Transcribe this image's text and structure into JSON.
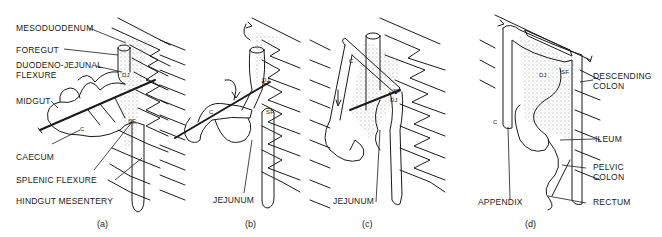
{
  "figure": {
    "type": "anatomical-diagram",
    "panels": [
      {
        "id": "a",
        "caption": "(a)",
        "labels": [
          "MESODUODENUM",
          "FOREGUT",
          "DUODENO-JEJUNAL",
          "FLEXURE",
          "MIDGUT",
          "CAECUM",
          "SPLENIC FLEXURE",
          "HINDGUT MESENTERY"
        ],
        "markers": [
          "DJ",
          "SF",
          "C"
        ]
      },
      {
        "id": "b",
        "caption": "(b)",
        "labels": [
          "JEJUNUM"
        ],
        "markers": [
          "DJ",
          "SF",
          "C"
        ]
      },
      {
        "id": "c",
        "caption": "(c)",
        "labels": [
          "JEJUNUM"
        ],
        "markers": [
          "C",
          "SF",
          "DJ"
        ]
      },
      {
        "id": "d",
        "caption": "(d)",
        "labels": [
          "DESCENDING",
          "COLON",
          "ILEUM",
          "PELVIC",
          "COLON",
          "APPENDIX",
          "RECTUM"
        ],
        "markers": [
          "DJ",
          "SF",
          "C"
        ]
      }
    ]
  },
  "text": {
    "a": {
      "mesoduodenum": "MESODUODENUM",
      "foregut": "FOREGUT",
      "dj_flexure_1": "DUODENO-JEJUNAL",
      "dj_flexure_2": "FLEXURE",
      "midgut": "MIDGUT",
      "caecum": "CAECUM",
      "splenic": "SPLENIC FLEXURE",
      "hindgut": "HINDGUT MESENTERY",
      "dj": "DJ",
      "sf": "SF",
      "c": "C",
      "caption": "(a)"
    },
    "b": {
      "jejunum": "JEJUNUM",
      "dj": "DJ",
      "sf": "SF",
      "c": "C",
      "caption": "(b)"
    },
    "c": {
      "jejunum": "JEJUNUM",
      "dj": "DJ",
      "sf": "SF",
      "c": "C",
      "caption": "(c)"
    },
    "d": {
      "descending_1": "DESCENDING",
      "descending_2": "COLON",
      "ileum": "ILEUM",
      "pelvic_1": "PELVIC",
      "pelvic_2": "COLON",
      "appendix": "APPENDIX",
      "rectum": "RECTUM",
      "dj": "DJ",
      "sf": "SF",
      "c": "C",
      "caption": "(d)"
    }
  },
  "colors": {
    "ink": "#1a1a1a",
    "background": "#ffffff",
    "stipple": "#9a9a9a"
  }
}
